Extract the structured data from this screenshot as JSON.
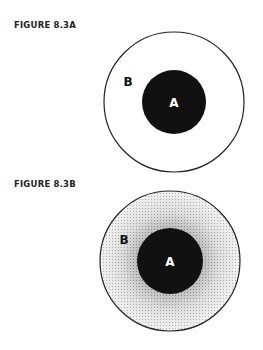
{
  "figures": [
    {
      "label": "FIGURE 8.3A",
      "outer_label": "B",
      "inner_label": "A",
      "style": "plain"
    },
    {
      "label": "FIGURE 8.3B",
      "outer_label": "B",
      "inner_label": "A",
      "style": "stippled-gradient"
    }
  ],
  "colors": {
    "ink": "#111111",
    "background": "#ffffff"
  }
}
